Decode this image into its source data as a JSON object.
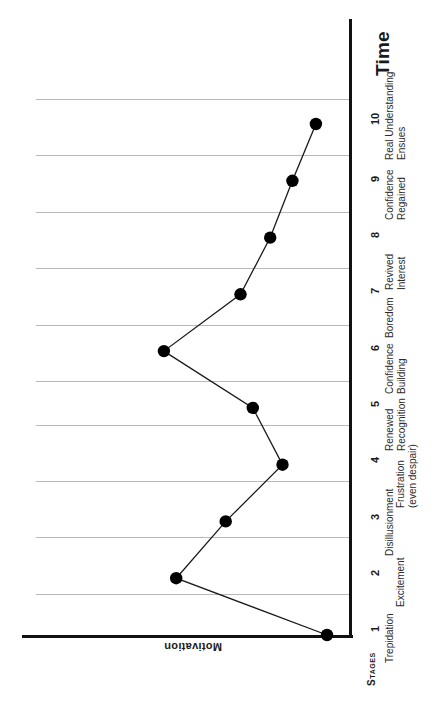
{
  "figure": {
    "kind": "line-chart",
    "orientation": "rotated-90-ccw",
    "category_axis_title": "Time",
    "value_axis_title": "Motivation",
    "category_group_title": "Stages",
    "ink_color": "#111111",
    "grid_color": "#b9b9b9",
    "marker_color": "#000000"
  },
  "chart_data": {
    "type": "line",
    "title": "",
    "subtitle": "",
    "xlabel": "Time",
    "ylabel": "Motivation",
    "grid": true,
    "legend": "none",
    "orientation": "rotated-90-ccw",
    "categories": [
      "1",
      "2",
      "3",
      "4",
      "5",
      "6",
      "7",
      "8",
      "9",
      "10"
    ],
    "category_names": [
      "Trepidation",
      "Excitement",
      "Disillusionment",
      "Frustration (even despair)",
      "Renewed Recognition",
      "Confidence Building",
      "Boredom",
      "Revived Interest",
      "Confidence Regained",
      "Real Understanding Ensues"
    ],
    "values": [
      0,
      6.1,
      4.1,
      1.8,
      3.0,
      6.6,
      3.5,
      2.3,
      1.4,
      0.45
    ],
    "ylim": [
      0,
      10.6
    ],
    "xlim": [
      1,
      10
    ],
    "ytick_count": 10,
    "markers": "filled-circle",
    "series": [
      {
        "name": "Motivation",
        "values": [
          0,
          6.1,
          4.1,
          1.8,
          3.0,
          6.6,
          3.5,
          2.3,
          1.4,
          0.45
        ]
      }
    ]
  },
  "ticks": [
    {
      "num": "1",
      "line1": "Trepidation",
      "line2": ""
    },
    {
      "num": "2",
      "line1": "Excitement",
      "line2": ""
    },
    {
      "num": "3",
      "line1": "Disillusionment",
      "line2": ""
    },
    {
      "num": "4",
      "line1": "Frustration",
      "line2": "(even despair)"
    },
    {
      "num": "5",
      "line1": "Renewed",
      "line2": "Recognition"
    },
    {
      "num": "6",
      "line1": "Confidence",
      "line2": "Building"
    },
    {
      "num": "7",
      "line1": "Boredom",
      "line2": ""
    },
    {
      "num": "8",
      "line1": "Revived",
      "line2": "Interest"
    },
    {
      "num": "9",
      "line1": "Confidence",
      "line2": "Regained"
    },
    {
      "num": "10",
      "line1": "Real Understanding",
      "line2": "Ensues"
    }
  ]
}
